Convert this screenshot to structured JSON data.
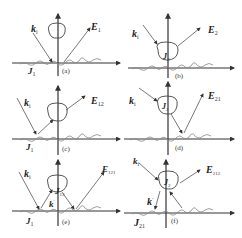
{
  "diagram": {
    "type": "scattering-geometry-panels",
    "layout": {
      "rows": 3,
      "cols": 2
    },
    "panels": [
      {
        "id": "a",
        "caption": "(a)",
        "incident": {
          "main": "k",
          "sub": "i"
        },
        "field": {
          "main": "E",
          "sub": "1"
        },
        "current": {
          "main": "J",
          "sub": "1"
        },
        "object_current": null,
        "reflected": null
      },
      {
        "id": "b",
        "caption": "(b)",
        "incident": {
          "main": "k",
          "sub": "i"
        },
        "field": {
          "main": "E",
          "sub": "2"
        },
        "current": null,
        "object_current": {
          "main": "J",
          "sub": "2"
        },
        "reflected": null
      },
      {
        "id": "c",
        "caption": "(c)",
        "incident": {
          "main": "k",
          "sub": "i"
        },
        "field": {
          "main": "E",
          "sub": "12"
        },
        "current": {
          "main": "J",
          "sub": "1"
        },
        "object_current": null,
        "reflected": null
      },
      {
        "id": "d",
        "caption": "(d)",
        "incident": {
          "main": "k",
          "sub": "i"
        },
        "field": {
          "main": "E",
          "sub": "21"
        },
        "current": null,
        "object_current": {
          "main": "J",
          "sub": "2"
        },
        "reflected": null
      },
      {
        "id": "e",
        "caption": "(e)",
        "incident": {
          "main": "k",
          "sub": "i"
        },
        "field": {
          "main": "E",
          "sub": "121"
        },
        "current": {
          "main": "J",
          "sub": "1"
        },
        "object_current": {
          "main": "J",
          "sub": "12"
        },
        "reflected": {
          "main": "k",
          "sub": "i",
          "prime": "′"
        }
      },
      {
        "id": "f",
        "caption": "(f)",
        "incident": {
          "main": "k",
          "sub": "i"
        },
        "field": {
          "main": "E",
          "sub": "212"
        },
        "current": {
          "main": "J",
          "sub": "21"
        },
        "object_current": {
          "main": "J",
          "sub": "2"
        },
        "reflected": {
          "main": "k",
          "sub": "i",
          "prime": "′"
        }
      }
    ],
    "colors": {
      "axis": "#333333",
      "ray": "#444444",
      "surface": "#777777",
      "object": "#444444"
    }
  }
}
